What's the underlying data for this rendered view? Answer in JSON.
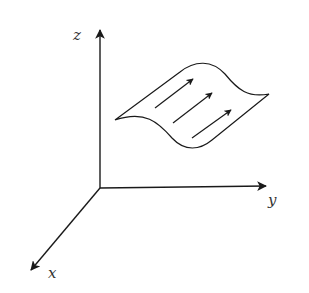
{
  "figure": {
    "colors": {
      "stroke": "#1a1a1a",
      "label": "#333333",
      "background": "#ffffff"
    },
    "axes": {
      "z": {
        "label": "z"
      },
      "y": {
        "label": "y"
      },
      "x": {
        "label": "x"
      }
    },
    "surface": {
      "arrow_count": 3
    }
  }
}
